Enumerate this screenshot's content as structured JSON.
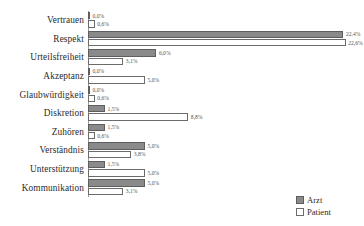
{
  "chart_data": {
    "type": "bar",
    "orientation": "horizontal",
    "title": "",
    "subtitle": "",
    "xlabel": "",
    "ylabel": "",
    "xlim": [
      0,
      23.5
    ],
    "grid": false,
    "value_suffix": "%",
    "legend_position": "bottom-right",
    "categories": [
      "Vertrauen",
      "Respekt",
      "Urteilsfreiheit",
      "Akzeptanz",
      "Glaubwürdigkeit",
      "Diskretion",
      "Zuhören",
      "Verständnis",
      "Unterstützung",
      "Kommunikation"
    ],
    "series": [
      {
        "name": "Arzt",
        "color": "#8a8a8a",
        "values": [
          0.0,
          22.4,
          6.0,
          0.0,
          0.0,
          1.5,
          1.5,
          5.0,
          1.5,
          5.0
        ],
        "labels": [
          "0,0%",
          "22,4%",
          "6,0%",
          "0,0%",
          "0,0%",
          "1,5%",
          "1,5%",
          "5,0%",
          "1,5%",
          "5,0%"
        ]
      },
      {
        "name": "Patient",
        "color": "#ffffff",
        "values": [
          0.6,
          22.6,
          3.1,
          5.0,
          0.6,
          8.8,
          0.6,
          3.8,
          5.0,
          3.1
        ],
        "labels": [
          "0,6%",
          "22,6%",
          "3,1%",
          "5,0%",
          "0,6%",
          "8,8%",
          "0,6%",
          "3,8%",
          "5,0%",
          "3,1%"
        ]
      }
    ]
  },
  "legend": {
    "items": [
      {
        "label": "Arzt"
      },
      {
        "label": "Patient"
      }
    ]
  }
}
